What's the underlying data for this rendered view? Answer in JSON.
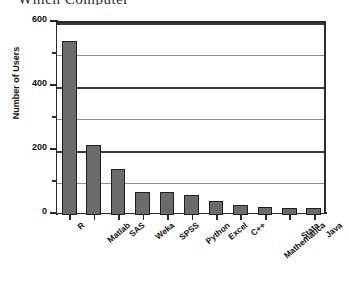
{
  "title_remnant": "Which Computer",
  "chart_data": {
    "type": "bar",
    "title": "",
    "xlabel": "",
    "ylabel": "Number of Users",
    "categories": [
      "R",
      "Matlab",
      "SAS",
      "Weka",
      "SPSS",
      "Python",
      "Excel",
      "C++",
      "Mathematica",
      "Stata",
      "Java"
    ],
    "values": [
      545,
      220,
      145,
      72,
      72,
      62,
      45,
      32,
      25,
      22,
      22
    ],
    "ylim": [
      0,
      600
    ],
    "ymajor_ticks": [
      0,
      200,
      400,
      600
    ],
    "yminor_ticks": [
      100,
      300,
      500
    ],
    "ytick_labels": [
      "0",
      "200",
      "400",
      "600"
    ],
    "grid": true,
    "legend": "none",
    "bar_color": "#6b6b6b",
    "bar_edge_color": "#1f1f1f",
    "axis_color": "#2a2a2a",
    "gridline_major_color": "#3a3a3a",
    "gridline_minor_color": "#8e8e8e",
    "background": "#ffffff"
  }
}
